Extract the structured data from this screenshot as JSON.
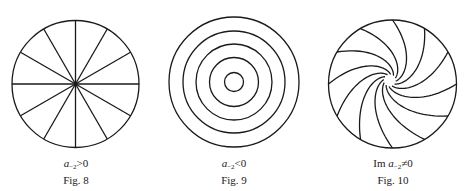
{
  "figures": [
    {
      "id": "fig8",
      "label": "Fig. 8",
      "condition": {
        "prefix": "",
        "var": "a",
        "sub": "−2",
        "relation": ">0"
      },
      "kind": "radial-lines",
      "center": [
        75.5,
        84
      ],
      "radius": 63.5,
      "line_count": 12
    },
    {
      "id": "fig9",
      "label": "Fig. 9",
      "condition": {
        "prefix": "",
        "var": "a",
        "sub": "−2",
        "relation": "<0"
      },
      "kind": "concentric-circles",
      "center": [
        234,
        82
      ],
      "radii": [
        65,
        51,
        38,
        24.5,
        9.5
      ]
    },
    {
      "id": "fig10",
      "label": "Fig. 10",
      "condition": {
        "prefix": "Im ",
        "var": "a",
        "sub": "−2",
        "relation": "≠0"
      },
      "kind": "spiral-arms",
      "center": [
        392.5,
        84
      ],
      "radius": 64,
      "arm_count": 12,
      "twist": 0.72
    }
  ],
  "colors": {
    "stroke": "#1a1a1a",
    "background": "#ffffff"
  }
}
